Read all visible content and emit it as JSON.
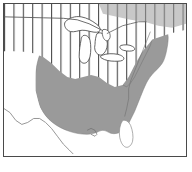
{
  "figure": {
    "type": "distribution-range-map",
    "title": "Distribution map of eastern North America",
    "caption": "",
    "width_px": 192,
    "height_px": 172
  },
  "frame": {
    "border_color": "#4a4a4a",
    "border_width_px": 1.4,
    "background_color": "#ffffff",
    "left_px": 3,
    "top_px": 3,
    "width_px": 184,
    "height_px": 154
  },
  "colors": {
    "background": "#ffffff",
    "land_shaded": "#9a9a9a",
    "land_unshaded": "#ffffff",
    "coastline": "#6e6e6e",
    "lake_fill": "#ffffff",
    "lake_outline": "#3c3c3c",
    "hatch_line": "#4a4a4a",
    "border_line": "#5a5a5a",
    "frame": "#4a4a4a"
  },
  "legend_symbols": [
    {
      "name": "solid-gray-fill",
      "label": "Shaded range area",
      "color": "#9a9a9a",
      "pattern": "solid"
    },
    {
      "name": "vertical-hatch",
      "label": "Vertically hatched area",
      "color": "#4a4a4a",
      "pattern": "vertical-lines",
      "spacing_px": 9.5,
      "line_width_px": 1.1
    },
    {
      "name": "white-fill",
      "label": "Unshaded area",
      "color": "#ffffff",
      "pattern": "none"
    }
  ],
  "regions": [
    {
      "name": "shaded-range",
      "label": "Shaded distribution area",
      "fill": "#9a9a9a",
      "extent": "Eastern and central United States plus southern Canada and Atlantic Canada"
    },
    {
      "name": "hatched-overlay",
      "label": "Vertically hatched overlay zone",
      "fill": "vertical-hatch",
      "extent": "Northern tier from the northern Great Plains east across the Great Lakes to New England"
    },
    {
      "name": "great-lakes",
      "label": "Great Lakes",
      "fill": "#ffffff",
      "outline": "#3c3c3c"
    },
    {
      "name": "florida-peninsula",
      "label": "Florida peninsula unshaded",
      "fill": "#ffffff",
      "outline": "#6e6e6e"
    },
    {
      "name": "western-unshaded",
      "label": "Western United States unshaded",
      "fill": "#ffffff"
    }
  ],
  "boundary_lines": [
    {
      "name": "northern-border",
      "label": "Northern international border",
      "color": "#5a5a5a"
    },
    {
      "name": "southwest-border",
      "label": "Southwestern international border",
      "color": "#8a8a8a"
    }
  ],
  "labels": {
    "visible_text": []
  }
}
